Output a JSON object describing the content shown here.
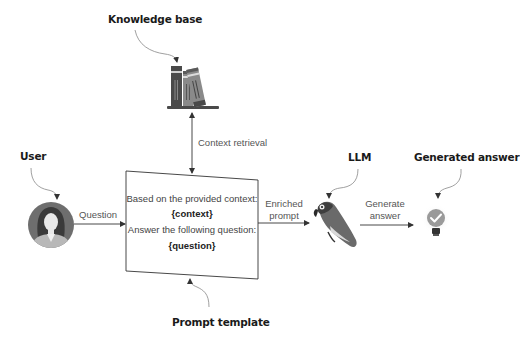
{
  "diagram": {
    "type": "flow",
    "nodes": {
      "knowledge_base": {
        "label": "Knowledge base",
        "icon": "books-icon"
      },
      "user": {
        "label": "User",
        "icon": "user-avatar-icon"
      },
      "prompt_template": {
        "label": "Prompt template",
        "lines": [
          "Based on the provided context:",
          "{context}",
          "Answer the following question:",
          "{question}"
        ]
      },
      "llm": {
        "label": "LLM",
        "icon": "parrot-icon"
      },
      "generated_answer": {
        "label": "Generated answer",
        "icon": "lightbulb-check-icon"
      }
    },
    "edges": {
      "context_retrieval": {
        "label": "Context retrieval",
        "from": "knowledge_base",
        "to": "prompt_template",
        "bidirectional": true
      },
      "question": {
        "label": "Question",
        "from": "user",
        "to": "prompt_template"
      },
      "enriched_prompt": {
        "line1": "Enriched",
        "line2": "prompt",
        "from": "prompt_template",
        "to": "llm"
      },
      "generate_answer": {
        "line1": "Generate",
        "line2": "answer",
        "from": "llm",
        "to": "generated_answer"
      }
    },
    "colors": {
      "line": "#555555",
      "text": "#1a1a1a",
      "icon_dark": "#4a4a4a",
      "icon_mid": "#8a8a8a",
      "icon_light": "#c8c8c8"
    }
  }
}
